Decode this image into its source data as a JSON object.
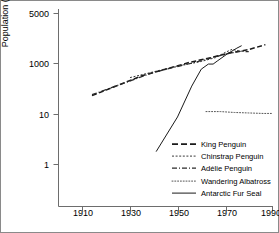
{
  "chart_data": {
    "type": "line",
    "title": "",
    "xlabel": "",
    "ylabel": "Population (hundreds)",
    "yscale": "log",
    "ylim": [
      0.3,
      9000
    ],
    "xlim": [
      1900,
      1993
    ],
    "grid": false,
    "legend_position": "lower-right",
    "xticks": [
      1910,
      1930,
      1950,
      1970,
      1990
    ],
    "yticks": [
      1,
      10,
      1000,
      5000
    ],
    "ytick_labels": [
      "1",
      "10",
      "1000",
      "5000"
    ],
    "series": [
      {
        "name": "King Penguin",
        "style": "dashed",
        "color": "#1a1a1a",
        "points": [
          [
            1914,
            55
          ],
          [
            1935,
            330
          ],
          [
            1955,
            1100
          ],
          [
            1964,
            1700
          ],
          [
            1972,
            2600
          ],
          [
            1980,
            3500
          ],
          [
            1987,
            5500
          ]
        ]
      },
      {
        "name": "Chinstrap Penguin",
        "style": "fine-dashed",
        "color": "#3a3a3a",
        "points": [
          [
            1930,
            280
          ],
          [
            1950,
            800
          ],
          [
            1960,
            1200
          ],
          [
            1966,
            1700
          ],
          [
            1970,
            2700
          ],
          [
            1973,
            3600
          ],
          [
            1976,
            3100
          ],
          [
            1978,
            3000
          ]
        ]
      },
      {
        "name": "Adélie Penguin",
        "style": "dash-dot",
        "color": "#2a2a2a",
        "points": [
          [
            1914,
            60
          ],
          [
            1940,
            450
          ],
          [
            1958,
            1150
          ],
          [
            1965,
            1750
          ],
          [
            1972,
            2550
          ],
          [
            1977,
            3000
          ],
          [
            1980,
            2900
          ]
        ]
      },
      {
        "name": "Wandering Albatross",
        "style": "dotted",
        "color": "#555555",
        "points": [
          [
            1962,
            13
          ],
          [
            1968,
            13
          ],
          [
            1974,
            12
          ],
          [
            1980,
            11.5
          ],
          [
            1986,
            11
          ],
          [
            1990,
            11
          ]
        ]
      },
      {
        "name": "Antarctic Fur Seal",
        "style": "solid",
        "color": "#1a1a1a",
        "points": [
          [
            1941,
            0.35
          ],
          [
            1950,
            8
          ],
          [
            1956,
            130
          ],
          [
            1960,
            600
          ],
          [
            1963,
            950
          ],
          [
            1965,
            950
          ],
          [
            1967,
            1300
          ],
          [
            1971,
            2400
          ],
          [
            1975,
            4000
          ],
          [
            1977,
            5000
          ]
        ]
      }
    ]
  },
  "axes": {
    "ylabel": "Population (hundreds)",
    "ytick_labels": [
      "5000",
      "1000",
      "10",
      "1"
    ],
    "xtick_labels": [
      "1910",
      "1930",
      "1950",
      "1970",
      "1990"
    ]
  },
  "legend": {
    "items": [
      {
        "label": "King Penguin",
        "key": "dashed-line-key"
      },
      {
        "label": "Chinstrap Penguin",
        "key": "fine-dashed-line-key"
      },
      {
        "label": "Adélie Penguin",
        "key": "dash-dot-line-key"
      },
      {
        "label": "Wandering Albatross",
        "key": "dotted-line-key"
      },
      {
        "label": "Antarctic Fur Seal",
        "key": "solid-line-key"
      }
    ]
  }
}
